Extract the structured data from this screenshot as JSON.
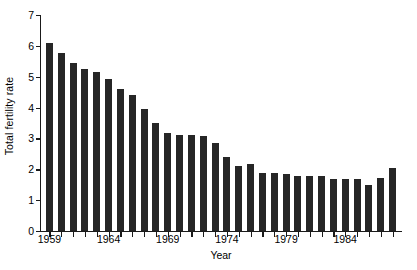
{
  "chart_data": {
    "type": "bar",
    "title": "",
    "xlabel": "Year",
    "ylabel": "Total fertility rate",
    "ylim": [
      0,
      7
    ],
    "y_ticks": [
      0,
      1,
      2,
      3,
      4,
      5,
      6,
      7
    ],
    "y_tick_labels": [
      "0",
      "1",
      "2",
      "3",
      "4",
      "5",
      "6",
      "7"
    ],
    "x_tick_labels": [
      "1959",
      "1964",
      "1969",
      "1974",
      "1979",
      "1984"
    ],
    "x_labeled_years": [
      1959,
      1964,
      1969,
      1974,
      1979,
      1984
    ],
    "grid": false,
    "legend": false,
    "legend_position": "none",
    "bar_color": "#262626",
    "axis_color": "#1a1a1a",
    "background_color": "#ffffff",
    "categories": [
      "1959",
      "1960",
      "1961",
      "1962",
      "1963",
      "1964",
      "1965",
      "1966",
      "1967",
      "1968",
      "1969",
      "1970",
      "1971",
      "1972",
      "1973",
      "1974",
      "1975",
      "1976",
      "1977",
      "1978",
      "1979",
      "1980",
      "1981",
      "1982",
      "1983",
      "1984",
      "1985",
      "1986",
      "1987",
      "1988"
    ],
    "values": [
      6.1,
      5.78,
      5.43,
      5.24,
      5.14,
      4.93,
      4.59,
      4.4,
      3.94,
      3.51,
      3.17,
      3.11,
      3.1,
      3.09,
      2.84,
      2.41,
      2.12,
      2.16,
      1.87,
      1.88,
      1.85,
      1.78,
      1.79,
      1.78,
      1.67,
      1.68,
      1.7,
      1.5,
      1.72,
      2.05
    ]
  }
}
